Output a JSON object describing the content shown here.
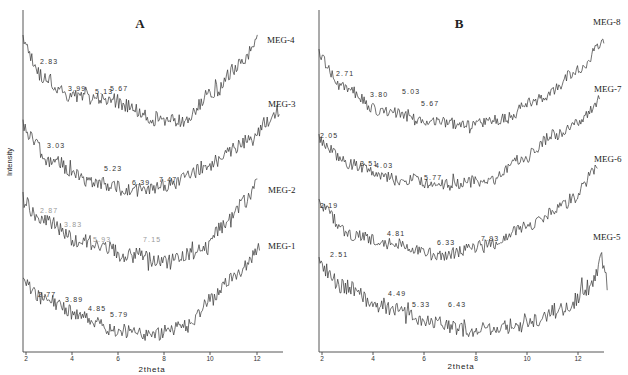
{
  "chart_data": [
    {
      "type": "line",
      "panel": "A",
      "title": "A",
      "xlabel": "2theta",
      "ylabel": "Intensity",
      "xlim": [
        2,
        13
      ],
      "xticks": [
        2,
        4,
        6,
        8,
        10,
        12
      ],
      "grid": false,
      "series": [
        {
          "name": "MEG-4",
          "peaks": [
            2.83,
            3.99,
            5.13,
            5.67
          ],
          "shape": "U-shaped baseline, high at 2, min near 8, rising to max near 12"
        },
        {
          "name": "MEG-3",
          "peaks": [
            3.03,
            5.23,
            6.39,
            7.47
          ],
          "shape": "decreasing to min near 6-7, rising to max near 13"
        },
        {
          "name": "MEG-2",
          "peaks": [
            2.87,
            3.83,
            5.93,
            7.15
          ],
          "shape": "decreasing to min near 7-8, rising to max near 12"
        },
        {
          "name": "MEG-1",
          "peaks": [
            2.77,
            3.89,
            4.85,
            5.79
          ],
          "shape": "decreasing to min near 7, rising to max near 12"
        }
      ]
    },
    {
      "type": "line",
      "panel": "B",
      "title": "B",
      "xlabel": "2theta",
      "ylabel": "",
      "xlim": [
        2,
        13
      ],
      "xticks": [
        2,
        4,
        6,
        8,
        10,
        12
      ],
      "grid": false,
      "series": [
        {
          "name": "MEG-8",
          "peaks": [
            2.71,
            3.8,
            5.03,
            5.67
          ],
          "shape": "decreasing to min near 8, rising to max near 13"
        },
        {
          "name": "MEG-7",
          "peaks": [
            2.05,
            3.51,
            4.03,
            5.77
          ],
          "shape": "decreasing to min near 7, rising to max near 12.5"
        },
        {
          "name": "MEG-6",
          "peaks": [
            2.19,
            4.81,
            6.33,
            7.93
          ],
          "shape": "decreasing to min near 6, rising to max near 12.5"
        },
        {
          "name": "MEG-5",
          "peaks": [
            2.51,
            4.49,
            5.33,
            6.43
          ],
          "shape": "decreasing to min near 7, rising to max near 12.8"
        }
      ]
    }
  ],
  "panelA": {
    "title": "A",
    "xlabel": "2theta",
    "ylabel": "Intensity",
    "ticks": [
      "2",
      "4",
      "6",
      "8",
      "10",
      "12"
    ],
    "series": [
      {
        "label": "MEG-4",
        "peaks": [
          "2.83",
          "3.99",
          "5.13",
          "5.67"
        ]
      },
      {
        "label": "MEG-3",
        "peaks": [
          "3.03",
          "5.23",
          "6.39",
          "7.47"
        ]
      },
      {
        "label": "MEG-2",
        "peaks": [
          "2.87",
          "3.83",
          "5.93",
          "7.15"
        ]
      },
      {
        "label": "MEG-1",
        "peaks": [
          "2.77",
          "3.89",
          "4.85",
          "5.79"
        ]
      }
    ]
  },
  "panelB": {
    "title": "B",
    "xlabel": "2theta",
    "ticks": [
      "2",
      "4",
      "6",
      "8",
      "10",
      "12"
    ],
    "series": [
      {
        "label": "MEG-8",
        "peaks": [
          "2.71",
          "3.80",
          "5.03",
          "5.67"
        ]
      },
      {
        "label": "MEG-7",
        "peaks": [
          "2.05",
          "3.51",
          "4.03",
          "5.77"
        ]
      },
      {
        "label": "MEG-6",
        "peaks": [
          "2.19",
          "4.81",
          "6.33",
          "7.93"
        ]
      },
      {
        "label": "MEG-5",
        "peaks": [
          "2.51",
          "4.49",
          "5.33",
          "6.43"
        ]
      }
    ]
  }
}
